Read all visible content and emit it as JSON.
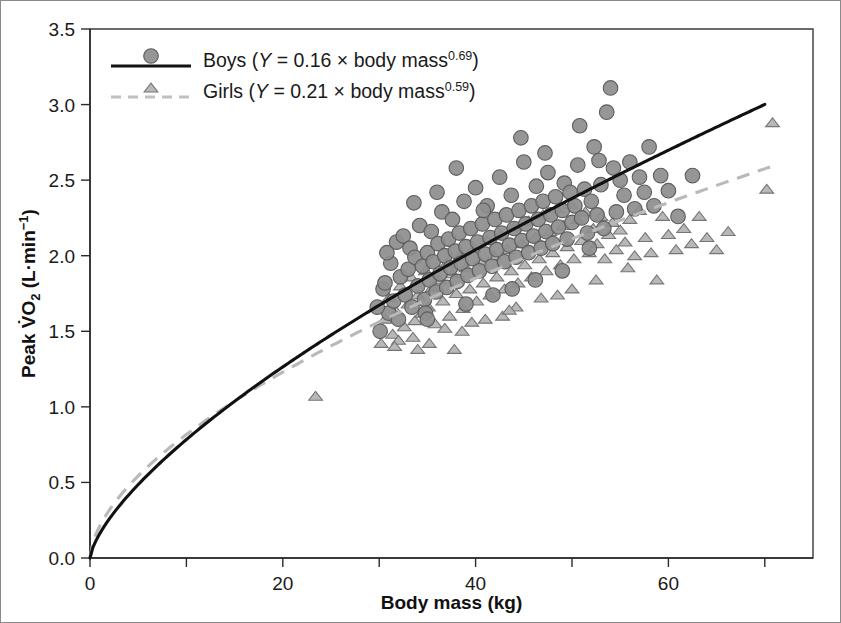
{
  "chart_data": {
    "type": "scatter",
    "title": "",
    "xlabel": "Body mass (kg)",
    "ylabel": "Peak V̇O₂ (L·min⁻¹)",
    "xlim": [
      0,
      75
    ],
    "ylim": [
      0.0,
      3.5
    ],
    "xticks": [
      0,
      20,
      40,
      60
    ],
    "xtick_labels": [
      "0",
      "20",
      "40",
      "60"
    ],
    "xminor_ticks": [
      10,
      30,
      50,
      70
    ],
    "yticks": [
      0.0,
      0.5,
      1.0,
      1.5,
      2.0,
      2.5,
      3.0,
      3.5
    ],
    "ytick_labels": [
      "0.0",
      "0.5",
      "1.0",
      "1.5",
      "2.0",
      "2.5",
      "3.0",
      "3.5"
    ],
    "grid": false,
    "legend_position": "top-left",
    "frame": "box",
    "colors": {
      "boys_marker_fill": "#8e8e8e",
      "boys_marker_edge": "#5d5d5d",
      "boys_line": "#111111",
      "girls_marker_fill": "#b3b3b3",
      "girls_marker_edge": "#767676",
      "girls_line": "#b9b9b9",
      "axis": "#2b2b2b",
      "background": "#ffffff"
    },
    "series": [
      {
        "name": "Boys",
        "marker": "circle",
        "linestyle": "solid",
        "legend_label": "Boys (Y = 0.16 × body mass0.69)",
        "legend_prefix": "Boys (",
        "legend_var": "Y",
        "legend_equation": " = 0.16 × body mass",
        "legend_exponent": "0.69",
        "legend_suffix": ")",
        "fit": {
          "type": "power",
          "coefficient": 0.16,
          "exponent": 0.69,
          "x_range": [
            0,
            70
          ]
        },
        "points": [
          [
            30.1,
            1.5
          ],
          [
            30.4,
            1.78
          ],
          [
            30.6,
            1.82
          ],
          [
            31.0,
            1.62
          ],
          [
            31.2,
            1.95
          ],
          [
            31.5,
            1.7
          ],
          [
            31.8,
            2.09
          ],
          [
            32.0,
            1.58
          ],
          [
            32.2,
            1.86
          ],
          [
            32.5,
            2.13
          ],
          [
            32.7,
            1.74
          ],
          [
            33.0,
            1.91
          ],
          [
            33.2,
            2.05
          ],
          [
            33.4,
            1.66
          ],
          [
            33.7,
            1.99
          ],
          [
            34.0,
            1.8
          ],
          [
            34.2,
            2.2
          ],
          [
            34.5,
            1.93
          ],
          [
            34.7,
            1.71
          ],
          [
            35.0,
            2.02
          ],
          [
            35.2,
            1.84
          ],
          [
            35.4,
            2.16
          ],
          [
            35.6,
            1.96
          ],
          [
            35.9,
            1.76
          ],
          [
            36.1,
            2.08
          ],
          [
            36.3,
            1.88
          ],
          [
            36.5,
            2.29
          ],
          [
            36.8,
            2.0
          ],
          [
            37.0,
            1.79
          ],
          [
            37.2,
            2.11
          ],
          [
            37.4,
            1.92
          ],
          [
            37.6,
            2.24
          ],
          [
            37.9,
            2.03
          ],
          [
            38.1,
            1.83
          ],
          [
            38.3,
            2.15
          ],
          [
            38.5,
            1.95
          ],
          [
            38.8,
            2.36
          ],
          [
            39.0,
            2.06
          ],
          [
            39.2,
            1.87
          ],
          [
            39.5,
            2.18
          ],
          [
            39.7,
            1.98
          ],
          [
            40.0,
            2.45
          ],
          [
            40.2,
            2.09
          ],
          [
            40.4,
            1.9
          ],
          [
            40.7,
            2.21
          ],
          [
            41.0,
            2.01
          ],
          [
            41.2,
            2.33
          ],
          [
            41.5,
            2.12
          ],
          [
            41.7,
            1.93
          ],
          [
            42.0,
            2.24
          ],
          [
            42.2,
            2.04
          ],
          [
            42.5,
            2.52
          ],
          [
            42.7,
            2.15
          ],
          [
            43.0,
            1.96
          ],
          [
            43.2,
            2.27
          ],
          [
            43.5,
            2.07
          ],
          [
            43.7,
            2.4
          ],
          [
            44.0,
            2.18
          ],
          [
            44.2,
            1.99
          ],
          [
            44.5,
            2.3
          ],
          [
            44.8,
            2.1
          ],
          [
            45.0,
            2.62
          ],
          [
            45.2,
            2.21
          ],
          [
            45.5,
            2.02
          ],
          [
            45.8,
            2.33
          ],
          [
            46.0,
            2.13
          ],
          [
            46.3,
            2.46
          ],
          [
            46.5,
            2.24
          ],
          [
            46.8,
            2.05
          ],
          [
            47.0,
            2.36
          ],
          [
            47.3,
            2.16
          ],
          [
            47.5,
            2.55
          ],
          [
            47.8,
            2.27
          ],
          [
            48.0,
            2.08
          ],
          [
            48.3,
            2.39
          ],
          [
            48.6,
            2.19
          ],
          [
            49.0,
            2.3
          ],
          [
            49.2,
            2.48
          ],
          [
            49.5,
            2.11
          ],
          [
            49.8,
            2.42
          ],
          [
            50.0,
            2.22
          ],
          [
            50.3,
            2.33
          ],
          [
            50.6,
            2.6
          ],
          [
            51.0,
            2.25
          ],
          [
            51.3,
            2.44
          ],
          [
            51.6,
            2.15
          ],
          [
            52.0,
            2.36
          ],
          [
            52.3,
            2.72
          ],
          [
            52.6,
            2.27
          ],
          [
            53.0,
            2.47
          ],
          [
            53.3,
            2.18
          ],
          [
            53.6,
            2.95
          ],
          [
            54.0,
            3.11
          ],
          [
            54.3,
            2.58
          ],
          [
            54.6,
            2.29
          ],
          [
            55.0,
            2.5
          ],
          [
            55.4,
            2.4
          ],
          [
            56.0,
            2.62
          ],
          [
            56.5,
            2.31
          ],
          [
            57.0,
            2.52
          ],
          [
            57.5,
            2.42
          ],
          [
            58.0,
            2.72
          ],
          [
            58.5,
            2.33
          ],
          [
            59.2,
            2.53
          ],
          [
            60.0,
            2.43
          ],
          [
            61.0,
            2.26
          ],
          [
            62.5,
            2.53
          ],
          [
            33.6,
            2.35
          ],
          [
            38.0,
            2.58
          ],
          [
            44.7,
            2.78
          ],
          [
            47.2,
            2.68
          ],
          [
            50.8,
            2.86
          ],
          [
            52.8,
            2.63
          ],
          [
            36.0,
            2.42
          ],
          [
            40.8,
            2.3
          ],
          [
            29.8,
            1.66
          ],
          [
            30.8,
            2.02
          ],
          [
            34.8,
            1.62
          ],
          [
            43.8,
            1.78
          ],
          [
            46.2,
            1.84
          ],
          [
            49.0,
            1.9
          ],
          [
            51.8,
            2.05
          ],
          [
            39.0,
            1.68
          ],
          [
            41.8,
            1.74
          ],
          [
            35.0,
            1.58
          ]
        ]
      },
      {
        "name": "Girls",
        "marker": "triangle",
        "linestyle": "dashed",
        "legend_label": "Girls (Y = 0.21 × body mass0.59)",
        "legend_prefix": "Girls (",
        "legend_var": "Y",
        "legend_equation": " = 0.21 × body mass",
        "legend_exponent": "0.59",
        "legend_suffix": ")",
        "fit": {
          "type": "power",
          "coefficient": 0.21,
          "exponent": 0.59,
          "x_range": [
            0,
            71
          ]
        },
        "points": [
          [
            23.4,
            1.07
          ],
          [
            30.2,
            1.42
          ],
          [
            30.6,
            1.58
          ],
          [
            31.0,
            1.72
          ],
          [
            31.4,
            1.48
          ],
          [
            31.8,
            1.63
          ],
          [
            32.2,
            1.8
          ],
          [
            32.6,
            1.53
          ],
          [
            33.0,
            1.68
          ],
          [
            33.3,
            1.86
          ],
          [
            33.7,
            1.57
          ],
          [
            34.0,
            1.74
          ],
          [
            34.4,
            1.62
          ],
          [
            34.8,
            1.9
          ],
          [
            35.1,
            1.66
          ],
          [
            35.5,
            1.79
          ],
          [
            35.8,
            1.55
          ],
          [
            36.2,
            1.84
          ],
          [
            36.6,
            1.7
          ],
          [
            37.0,
            1.95
          ],
          [
            37.3,
            1.6
          ],
          [
            37.6,
            1.88
          ],
          [
            38.0,
            1.75
          ],
          [
            38.4,
            2.0
          ],
          [
            38.7,
            1.65
          ],
          [
            39.0,
            1.92
          ],
          [
            39.4,
            1.78
          ],
          [
            39.8,
            2.05
          ],
          [
            40.1,
            1.7
          ],
          [
            40.5,
            1.96
          ],
          [
            40.8,
            1.82
          ],
          [
            41.2,
            2.1
          ],
          [
            41.5,
            1.74
          ],
          [
            41.9,
            2.0
          ],
          [
            42.2,
            1.86
          ],
          [
            42.6,
            2.14
          ],
          [
            43.0,
            1.78
          ],
          [
            43.3,
            2.04
          ],
          [
            43.7,
            1.9
          ],
          [
            44.0,
            2.19
          ],
          [
            44.4,
            1.82
          ],
          [
            44.8,
            2.08
          ],
          [
            45.1,
            1.94
          ],
          [
            45.5,
            2.23
          ],
          [
            45.8,
            1.86
          ],
          [
            46.2,
            2.12
          ],
          [
            46.6,
            1.98
          ],
          [
            47.0,
            2.27
          ],
          [
            47.3,
            1.9
          ],
          [
            47.7,
            2.16
          ],
          [
            48.0,
            2.02
          ],
          [
            48.4,
            2.31
          ],
          [
            48.8,
            1.94
          ],
          [
            49.1,
            2.2
          ],
          [
            49.5,
            2.06
          ],
          [
            49.9,
            2.34
          ],
          [
            50.2,
            1.98
          ],
          [
            50.6,
            2.24
          ],
          [
            51.0,
            2.1
          ],
          [
            51.4,
            2.29
          ],
          [
            51.8,
            2.02
          ],
          [
            52.2,
            2.18
          ],
          [
            52.6,
            2.08
          ],
          [
            53.0,
            2.26
          ],
          [
            53.4,
            1.98
          ],
          [
            53.8,
            2.14
          ],
          [
            54.2,
            2.22
          ],
          [
            54.6,
            2.04
          ],
          [
            55.0,
            2.17
          ],
          [
            55.5,
            2.09
          ],
          [
            56.0,
            2.24
          ],
          [
            56.5,
            2.0
          ],
          [
            57.0,
            2.3
          ],
          [
            57.6,
            2.12
          ],
          [
            58.2,
            2.02
          ],
          [
            58.8,
            1.84
          ],
          [
            59.4,
            2.26
          ],
          [
            60.0,
            2.14
          ],
          [
            60.8,
            2.04
          ],
          [
            61.6,
            2.18
          ],
          [
            62.4,
            2.08
          ],
          [
            63.2,
            2.26
          ],
          [
            64.0,
            2.12
          ],
          [
            65.0,
            2.04
          ],
          [
            66.2,
            2.16
          ],
          [
            70.8,
            2.88
          ],
          [
            70.2,
            2.44
          ],
          [
            34.0,
            1.38
          ],
          [
            35.2,
            1.42
          ],
          [
            37.8,
            1.38
          ],
          [
            42.8,
            1.6
          ],
          [
            32.0,
            1.44
          ],
          [
            33.5,
            1.46
          ],
          [
            36.8,
            1.52
          ],
          [
            44.2,
            1.66
          ],
          [
            46.8,
            1.72
          ],
          [
            50.0,
            1.78
          ],
          [
            52.5,
            1.84
          ],
          [
            55.8,
            1.92
          ],
          [
            39.6,
            1.56
          ],
          [
            31.6,
            1.4
          ],
          [
            38.6,
            1.5
          ],
          [
            41.0,
            1.58
          ],
          [
            43.5,
            1.64
          ],
          [
            48.5,
            1.74
          ]
        ]
      }
    ]
  }
}
